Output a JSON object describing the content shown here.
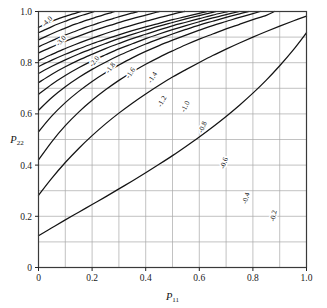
{
  "figure": {
    "kind": "contour-plot",
    "background_color": "#ffffff",
    "frame_color": "#3a3a3a",
    "grid_color": "#a8a8a8",
    "contour_color": "#141414"
  },
  "chart_data": {
    "type": "line",
    "subtype": "contour",
    "title": "",
    "subtitle": "",
    "xlabel": "P11",
    "ylabel": "P22",
    "xlabel_base": "P",
    "xlabel_sub": "11",
    "ylabel_base": "P",
    "ylabel_sub": "22",
    "xlim": [
      0,
      1
    ],
    "ylim": [
      0,
      1
    ],
    "grid": true,
    "grid_step": 0.1,
    "legend": "none",
    "legend_position": "none",
    "xticks": [
      0,
      0.2,
      0.4,
      0.6,
      0.8,
      1.0
    ],
    "xtick_labels": [
      "0",
      "0.2",
      "0.4",
      "0.6",
      "0.8",
      "1.0"
    ],
    "yticks": [
      0,
      0.2,
      0.4,
      0.6,
      0.8,
      1.0
    ],
    "ytick_labels": [
      "0",
      "0.2",
      "0.4",
      "0.6",
      "0.8",
      "1.0"
    ],
    "contour_levels": [
      -4.0,
      -3.5,
      -3.0,
      -2.6,
      -2.3,
      -2.0,
      -1.8,
      -1.6,
      -1.4,
      -1.2,
      -1.0,
      -0.8,
      -0.6,
      -0.4,
      -0.2
    ],
    "labeled_levels": [
      -4.0,
      -3.0,
      -2.0,
      -1.8,
      -1.6,
      -1.4,
      -1.2,
      -1.0,
      -0.8,
      -0.6,
      -0.4,
      -0.2
    ],
    "contour_labels": [
      "-4.0",
      "-3.0",
      "-2.0",
      "-1.8",
      "-1.6",
      "-1.4",
      "-1.2",
      "-1.0",
      "-0.8",
      "-0.6",
      "-0.4",
      "-0.2"
    ],
    "series": [
      {
        "name": "-4.0",
        "label": "-4.0",
        "labeled": true,
        "points": [
          [
            0.0,
            0.938
          ],
          [
            0.02,
            0.948
          ],
          [
            0.04,
            0.957
          ],
          [
            0.06,
            0.966
          ],
          [
            0.08,
            0.974
          ],
          [
            0.1,
            0.981
          ],
          [
            0.12,
            0.988
          ],
          [
            0.14,
            0.994
          ],
          [
            0.16,
            1.0
          ]
        ]
      },
      {
        "name": "-3.5",
        "label": "",
        "labeled": false,
        "points": [
          [
            0.0,
            0.917
          ],
          [
            0.025,
            0.929
          ],
          [
            0.05,
            0.941
          ],
          [
            0.075,
            0.952
          ],
          [
            0.1,
            0.962
          ],
          [
            0.125,
            0.972
          ],
          [
            0.15,
            0.981
          ],
          [
            0.175,
            0.989
          ],
          [
            0.2,
            0.997
          ],
          [
            0.208,
            1.0
          ]
        ]
      },
      {
        "name": "-3.0",
        "label": "-3.0",
        "labeled": true,
        "points": [
          [
            0.0,
            0.889
          ],
          [
            0.03,
            0.904
          ],
          [
            0.06,
            0.918
          ],
          [
            0.09,
            0.931
          ],
          [
            0.12,
            0.944
          ],
          [
            0.15,
            0.955
          ],
          [
            0.18,
            0.966
          ],
          [
            0.21,
            0.976
          ],
          [
            0.24,
            0.986
          ],
          [
            0.27,
            0.995
          ],
          [
            0.285,
            1.0
          ]
        ]
      },
      {
        "name": "-2.6",
        "label": "",
        "labeled": false,
        "points": [
          [
            0.0,
            0.862
          ],
          [
            0.035,
            0.879
          ],
          [
            0.07,
            0.895
          ],
          [
            0.105,
            0.91
          ],
          [
            0.14,
            0.924
          ],
          [
            0.175,
            0.938
          ],
          [
            0.21,
            0.95
          ],
          [
            0.245,
            0.962
          ],
          [
            0.28,
            0.973
          ],
          [
            0.315,
            0.984
          ],
          [
            0.35,
            0.994
          ],
          [
            0.372,
            1.0
          ]
        ]
      },
      {
        "name": "-2.3",
        "label": "",
        "labeled": false,
        "points": [
          [
            0.0,
            0.838
          ],
          [
            0.04,
            0.857
          ],
          [
            0.08,
            0.875
          ],
          [
            0.12,
            0.892
          ],
          [
            0.16,
            0.908
          ],
          [
            0.2,
            0.923
          ],
          [
            0.24,
            0.937
          ],
          [
            0.28,
            0.95
          ],
          [
            0.32,
            0.963
          ],
          [
            0.36,
            0.975
          ],
          [
            0.4,
            0.986
          ],
          [
            0.44,
            0.997
          ],
          [
            0.452,
            1.0
          ]
        ]
      },
      {
        "name": "-2.0",
        "label": "-2.0",
        "labeled": true,
        "points": [
          [
            0.0,
            0.808
          ],
          [
            0.045,
            0.83
          ],
          [
            0.09,
            0.851
          ],
          [
            0.135,
            0.87
          ],
          [
            0.18,
            0.888
          ],
          [
            0.225,
            0.905
          ],
          [
            0.27,
            0.921
          ],
          [
            0.315,
            0.936
          ],
          [
            0.36,
            0.95
          ],
          [
            0.405,
            0.963
          ],
          [
            0.45,
            0.976
          ],
          [
            0.495,
            0.988
          ],
          [
            0.54,
            0.999
          ],
          [
            0.545,
            1.0
          ]
        ]
      },
      {
        "name": "-1.8",
        "label": "-1.8",
        "labeled": true,
        "points": [
          [
            0.0,
            0.785
          ],
          [
            0.05,
            0.81
          ],
          [
            0.1,
            0.833
          ],
          [
            0.15,
            0.854
          ],
          [
            0.2,
            0.874
          ],
          [
            0.25,
            0.892
          ],
          [
            0.3,
            0.909
          ],
          [
            0.35,
            0.925
          ],
          [
            0.4,
            0.94
          ],
          [
            0.45,
            0.954
          ],
          [
            0.5,
            0.968
          ],
          [
            0.55,
            0.98
          ],
          [
            0.6,
            0.993
          ],
          [
            0.63,
            1.0
          ]
        ]
      },
      {
        "name": "-1.6",
        "label": "-1.6",
        "labeled": true,
        "points": [
          [
            0.0,
            0.758
          ],
          [
            0.05,
            0.786
          ],
          [
            0.1,
            0.811
          ],
          [
            0.15,
            0.834
          ],
          [
            0.2,
            0.855
          ],
          [
            0.25,
            0.875
          ],
          [
            0.3,
            0.894
          ],
          [
            0.35,
            0.911
          ],
          [
            0.4,
            0.927
          ],
          [
            0.45,
            0.943
          ],
          [
            0.5,
            0.957
          ],
          [
            0.55,
            0.971
          ],
          [
            0.6,
            0.984
          ],
          [
            0.65,
            0.997
          ],
          [
            0.662,
            1.0
          ]
        ]
      },
      {
        "name": "-1.4",
        "label": "-1.4",
        "labeled": true,
        "points": [
          [
            0.0,
            0.722
          ],
          [
            0.05,
            0.755
          ],
          [
            0.1,
            0.784
          ],
          [
            0.15,
            0.81
          ],
          [
            0.2,
            0.833
          ],
          [
            0.25,
            0.855
          ],
          [
            0.3,
            0.875
          ],
          [
            0.35,
            0.894
          ],
          [
            0.4,
            0.911
          ],
          [
            0.45,
            0.928
          ],
          [
            0.5,
            0.944
          ],
          [
            0.55,
            0.958
          ],
          [
            0.6,
            0.972
          ],
          [
            0.65,
            0.986
          ],
          [
            0.7,
            0.998
          ],
          [
            0.708,
            1.0
          ]
        ]
      },
      {
        "name": "-1.2",
        "label": "-1.2",
        "labeled": true,
        "points": [
          [
            0.0,
            0.676
          ],
          [
            0.05,
            0.716
          ],
          [
            0.1,
            0.75
          ],
          [
            0.15,
            0.78
          ],
          [
            0.2,
            0.807
          ],
          [
            0.25,
            0.831
          ],
          [
            0.3,
            0.854
          ],
          [
            0.35,
            0.874
          ],
          [
            0.4,
            0.894
          ],
          [
            0.45,
            0.912
          ],
          [
            0.5,
            0.929
          ],
          [
            0.55,
            0.945
          ],
          [
            0.6,
            0.96
          ],
          [
            0.65,
            0.975
          ],
          [
            0.7,
            0.988
          ],
          [
            0.75,
            1.0
          ]
        ]
      },
      {
        "name": "-1.0",
        "label": "-1.0",
        "labeled": true,
        "points": [
          [
            0.0,
            0.614
          ],
          [
            0.05,
            0.664
          ],
          [
            0.1,
            0.706
          ],
          [
            0.15,
            0.742
          ],
          [
            0.2,
            0.774
          ],
          [
            0.25,
            0.802
          ],
          [
            0.3,
            0.828
          ],
          [
            0.35,
            0.851
          ],
          [
            0.4,
            0.873
          ],
          [
            0.45,
            0.893
          ],
          [
            0.5,
            0.912
          ],
          [
            0.55,
            0.93
          ],
          [
            0.6,
            0.947
          ],
          [
            0.65,
            0.962
          ],
          [
            0.7,
            0.977
          ],
          [
            0.75,
            0.991
          ],
          [
            0.785,
            1.0
          ]
        ]
      },
      {
        "name": "-0.8",
        "label": "-0.8",
        "labeled": true,
        "points": [
          [
            0.0,
            0.53
          ],
          [
            0.05,
            0.592
          ],
          [
            0.1,
            0.644
          ],
          [
            0.15,
            0.688
          ],
          [
            0.2,
            0.727
          ],
          [
            0.25,
            0.761
          ],
          [
            0.3,
            0.791
          ],
          [
            0.35,
            0.819
          ],
          [
            0.4,
            0.844
          ],
          [
            0.45,
            0.867
          ],
          [
            0.5,
            0.888
          ],
          [
            0.55,
            0.908
          ],
          [
            0.6,
            0.927
          ],
          [
            0.65,
            0.945
          ],
          [
            0.7,
            0.961
          ],
          [
            0.75,
            0.977
          ],
          [
            0.8,
            0.992
          ],
          [
            0.827,
            1.0
          ]
        ]
      },
      {
        "name": "-0.6",
        "label": "-0.6",
        "labeled": true,
        "points": [
          [
            0.0,
            0.42
          ],
          [
            0.05,
            0.492
          ],
          [
            0.1,
            0.554
          ],
          [
            0.15,
            0.607
          ],
          [
            0.2,
            0.653
          ],
          [
            0.25,
            0.694
          ],
          [
            0.3,
            0.731
          ],
          [
            0.35,
            0.764
          ],
          [
            0.4,
            0.794
          ],
          [
            0.45,
            0.821
          ],
          [
            0.5,
            0.846
          ],
          [
            0.55,
            0.87
          ],
          [
            0.6,
            0.892
          ],
          [
            0.65,
            0.912
          ],
          [
            0.7,
            0.932
          ],
          [
            0.75,
            0.95
          ],
          [
            0.8,
            0.968
          ],
          [
            0.85,
            0.985
          ],
          [
            0.88,
            1.0
          ]
        ]
      },
      {
        "name": "-0.4",
        "label": "-0.4",
        "labeled": true,
        "points": [
          [
            0.0,
            0.282
          ],
          [
            0.05,
            0.349
          ],
          [
            0.1,
            0.41
          ],
          [
            0.15,
            0.465
          ],
          [
            0.2,
            0.515
          ],
          [
            0.25,
            0.561
          ],
          [
            0.3,
            0.603
          ],
          [
            0.35,
            0.642
          ],
          [
            0.4,
            0.678
          ],
          [
            0.45,
            0.712
          ],
          [
            0.5,
            0.744
          ],
          [
            0.55,
            0.773
          ],
          [
            0.6,
            0.801
          ],
          [
            0.65,
            0.828
          ],
          [
            0.7,
            0.853
          ],
          [
            0.75,
            0.877
          ],
          [
            0.8,
            0.9
          ],
          [
            0.85,
            0.922
          ],
          [
            0.9,
            0.943
          ],
          [
            0.95,
            0.963
          ],
          [
            1.0,
            0.982
          ]
        ]
      },
      {
        "name": "-0.2",
        "label": "-0.2",
        "labeled": true,
        "points": [
          [
            0.0,
            0.124
          ],
          [
            0.05,
            0.155
          ],
          [
            0.1,
            0.186
          ],
          [
            0.15,
            0.216
          ],
          [
            0.2,
            0.246
          ],
          [
            0.25,
            0.276
          ],
          [
            0.3,
            0.307
          ],
          [
            0.35,
            0.338
          ],
          [
            0.4,
            0.37
          ],
          [
            0.45,
            0.403
          ],
          [
            0.5,
            0.437
          ],
          [
            0.55,
            0.473
          ],
          [
            0.6,
            0.51
          ],
          [
            0.65,
            0.549
          ],
          [
            0.7,
            0.59
          ],
          [
            0.75,
            0.634
          ],
          [
            0.8,
            0.681
          ],
          [
            0.85,
            0.732
          ],
          [
            0.9,
            0.788
          ],
          [
            0.95,
            0.849
          ],
          [
            1.0,
            0.917
          ]
        ]
      }
    ],
    "annotations": [
      {
        "text": "-4.0",
        "x": 0.038,
        "y": 0.955,
        "rotation": -45
      },
      {
        "text": "-3.0",
        "x": 0.09,
        "y": 0.88,
        "rotation": -48
      },
      {
        "text": "-2.0",
        "x": 0.215,
        "y": 0.8,
        "rotation": -52
      },
      {
        "text": "-1.8",
        "x": 0.275,
        "y": 0.775,
        "rotation": -54
      },
      {
        "text": "-1.6",
        "x": 0.35,
        "y": 0.755,
        "rotation": -56
      },
      {
        "text": "-1.4",
        "x": 0.432,
        "y": 0.738,
        "rotation": -58
      },
      {
        "text": "-1.2",
        "x": 0.468,
        "y": 0.645,
        "rotation": -62
      },
      {
        "text": "-1.0",
        "x": 0.555,
        "y": 0.625,
        "rotation": -64
      },
      {
        "text": "-0.8",
        "x": 0.62,
        "y": 0.545,
        "rotation": -66
      },
      {
        "text": "-0.6",
        "x": 0.7,
        "y": 0.405,
        "rotation": -70
      },
      {
        "text": "-0.4",
        "x": 0.782,
        "y": 0.268,
        "rotation": -74
      },
      {
        "text": "-0.2",
        "x": 0.885,
        "y": 0.2,
        "rotation": -78
      }
    ]
  }
}
